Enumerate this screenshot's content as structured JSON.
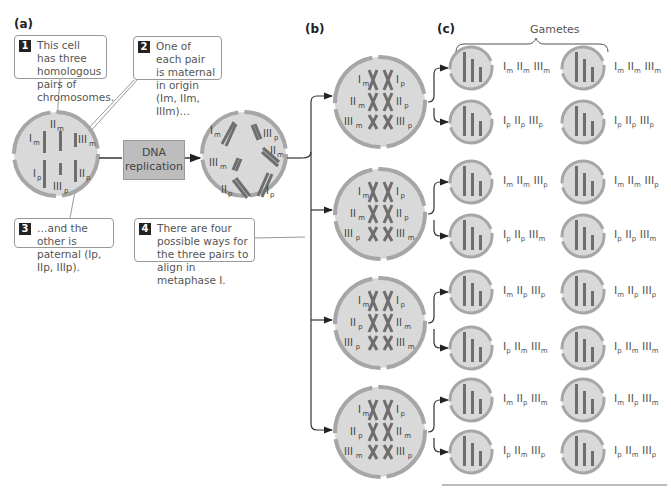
{
  "panels": {
    "a": "(a)",
    "b": "(b)",
    "c": "(c)"
  },
  "callouts": [
    {
      "num": "1",
      "text": "This cell has three homologous pairs of chromosomes."
    },
    {
      "num": "2",
      "text": "One of each pair is maternal in origin (Im, IIm, IIIm)…"
    },
    {
      "num": "3",
      "text": "…and the other is paternal (Ip, IIp, IIIp)."
    },
    {
      "num": "4",
      "text": "There are four possible ways for the three pairs to align in metaphase I."
    }
  ],
  "process_box": {
    "line1": "DNA",
    "line2": "replication"
  },
  "gametes_title": "Gametes",
  "alignments": [
    {
      "left": [
        "Im",
        "IIm",
        "IIIm"
      ],
      "right": [
        "Ip",
        "IIp",
        "IIIp"
      ],
      "gametes": [
        "Im IIm IIIm",
        "Ip IIp IIIp"
      ]
    },
    {
      "left": [
        "Im",
        "IIm",
        "IIIp"
      ],
      "right": [
        "Ip",
        "IIp",
        "IIIm"
      ],
      "gametes": [
        "Im IIm IIIp",
        "Ip IIp IIIm"
      ]
    },
    {
      "left": [
        "Im",
        "IIp",
        "IIIp"
      ],
      "right": [
        "Ip",
        "IIm",
        "IIIm"
      ],
      "gametes": [
        "Im IIp IIIp",
        "Ip IIm IIIm"
      ]
    },
    {
      "left": [
        "Im",
        "IIp",
        "IIIm"
      ],
      "right": [
        "Ip",
        "IIm",
        "IIIp"
      ],
      "gametes": [
        "Im IIp IIIm",
        "Ip IIm IIIp"
      ]
    }
  ],
  "colors": {
    "cell_fill": "#d9d9d9",
    "cell_border": "#a6a6a6",
    "chromosome": "#6e6e6e",
    "line": "#333333"
  }
}
